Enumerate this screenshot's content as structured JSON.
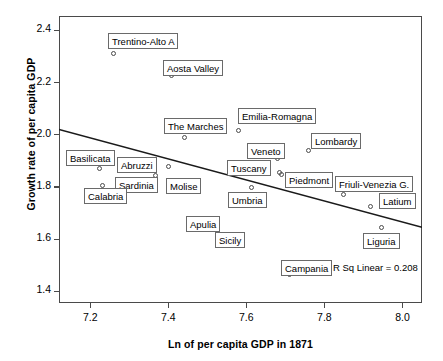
{
  "chart_data": {
    "type": "scatter",
    "title": "",
    "xlabel": "Ln of per capita GDP in 1871",
    "ylabel": "Growth rate of per capita GDP",
    "xlim": [
      7.12,
      8.05
    ],
    "ylim": [
      1.355,
      2.455
    ],
    "xticks": [
      "7.2",
      "7.4",
      "7.6",
      "7.8",
      "8.0"
    ],
    "xtick_values": [
      7.2,
      7.4,
      7.6,
      7.8,
      8.0
    ],
    "yticks": [
      "1.4",
      "1.6",
      "1.8",
      "2.0",
      "2.2",
      "2.4"
    ],
    "ytick_values": [
      1.4,
      1.6,
      1.8,
      2.0,
      2.2,
      2.4
    ],
    "grid": false,
    "legend": "none",
    "annotation": "R Sq Linear = 0.208",
    "r_squared": 0.208,
    "marker": "open-circle",
    "fit_line": {
      "type": "linear",
      "x": [
        7.12,
        8.05
      ],
      "y": [
        2.02,
        1.645
      ]
    },
    "points": [
      {
        "label": "Trentino-Alto A",
        "x": 7.26,
        "y": 2.31,
        "lx": 108,
        "ly": 33
      },
      {
        "label": "Aosta Valley",
        "x": 7.408,
        "y": 2.228,
        "lx": 163,
        "ly": 60
      },
      {
        "label": "The Marches",
        "x": 7.441,
        "y": 1.991,
        "lx": 164,
        "ly": 118
      },
      {
        "label": "Emilia-Romagna",
        "x": 7.58,
        "y": 2.016,
        "lx": 238,
        "ly": 108
      },
      {
        "label": "Lombardy",
        "x": 7.759,
        "y": 1.94,
        "lx": 311,
        "ly": 133
      },
      {
        "label": "Veneto",
        "x": 7.679,
        "y": 1.908,
        "lx": 247,
        "ly": 143
      },
      {
        "label": "Tuscany",
        "x": 7.685,
        "y": 1.857,
        "lx": 227,
        "ly": 160
      },
      {
        "label": "Piedmont",
        "x": 7.691,
        "y": 1.848,
        "lx": 285,
        "ly": 172
      },
      {
        "label": "Basilicata",
        "x": 7.225,
        "y": 1.869,
        "lx": 66,
        "ly": 150
      },
      {
        "label": "Abruzzi",
        "x": 7.367,
        "y": 1.845,
        "lx": 117,
        "ly": 157
      },
      {
        "label": "Sardinia",
        "x": 7.401,
        "y": 1.88,
        "lx": 115,
        "ly": 177
      },
      {
        "label": "Molise",
        "x": 7.4,
        "y": 1.826,
        "lx": 166,
        "ly": 178
      },
      {
        "label": "Calabria",
        "x": 7.231,
        "y": 1.804,
        "lx": 84,
        "ly": 188
      },
      {
        "label": "Umbria",
        "x": 7.613,
        "y": 1.799,
        "lx": 228,
        "ly": 192
      },
      {
        "label": "Friuli-Venezia G.",
        "x": 7.849,
        "y": 1.77,
        "lx": 335,
        "ly": 176
      },
      {
        "label": "Latium",
        "x": 7.919,
        "y": 1.723,
        "lx": 379,
        "ly": 193
      },
      {
        "label": "Apulia",
        "x": 7.505,
        "y": 1.636,
        "lx": 186,
        "ly": 216
      },
      {
        "label": "Liguria",
        "x": 7.946,
        "y": 1.644,
        "lx": 363,
        "ly": 233
      },
      {
        "label": "Sicily",
        "x": 7.577,
        "y": 1.578,
        "lx": 215,
        "ly": 232
      },
      {
        "label": "Campania",
        "x": 7.71,
        "y": 1.466,
        "lx": 281,
        "ly": 260
      }
    ]
  }
}
